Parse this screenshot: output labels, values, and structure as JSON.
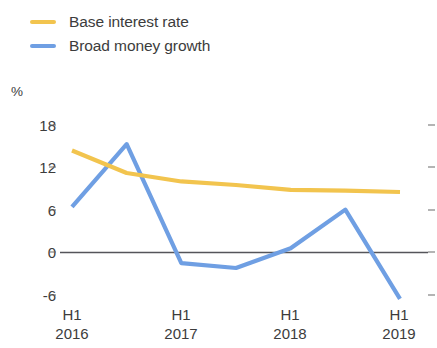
{
  "legend": {
    "items": [
      {
        "label": "Base interest rate",
        "color": "#f2c44e",
        "key": "base-interest-rate"
      },
      {
        "label": "Broad money growth",
        "color": "#6f9fe3",
        "key": "broad-money-growth"
      }
    ]
  },
  "axis": {
    "unit": "%",
    "y_ticks": [
      "18",
      "12",
      "6",
      "0",
      "-6"
    ],
    "x_labels": [
      {
        "line1": "H1",
        "line2": "2016"
      },
      {
        "line1": "H1",
        "line2": "2017"
      },
      {
        "line1": "H1",
        "line2": "2018"
      },
      {
        "line1": "H1",
        "line2": "2019"
      }
    ]
  },
  "colors": {
    "base_interest_rate": "#f2c44e",
    "broad_money_growth": "#6f9fe3",
    "zero_line": "#55555a",
    "tick": "#6b6b6b",
    "text": "#3c3c3c",
    "background": "#ffffff"
  },
  "chart_data": {
    "type": "line",
    "title": "",
    "subtitle": "",
    "xlabel": "",
    "ylabel": "%",
    "ylim": [
      -8.5,
      19.5
    ],
    "yticks": [
      18,
      12,
      6,
      0,
      -6
    ],
    "grid": false,
    "legend_position": "top-left",
    "zero_line": 0,
    "x": [
      "H1 2016",
      "H2 2016",
      "H1 2017",
      "H2 2017",
      "H1 2018",
      "H2 2018",
      "H1 2019"
    ],
    "x_tick_labels": [
      "H1 2016",
      "H1 2017",
      "H1 2018",
      "H1 2019"
    ],
    "series": [
      {
        "name": "Base interest rate",
        "color": "#f2c44e",
        "values": [
          14.5,
          11.3,
          10.1,
          9.6,
          8.9,
          8.8,
          8.6
        ]
      },
      {
        "name": "Broad money growth",
        "color": "#6f9fe3",
        "values": [
          6.5,
          15.4,
          -1.5,
          -2.2,
          0.6,
          6.1,
          -6.6
        ]
      }
    ]
  }
}
